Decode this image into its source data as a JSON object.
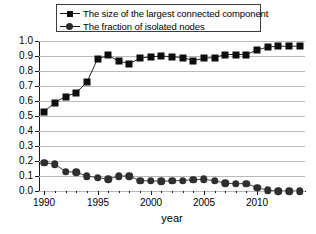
{
  "chart_data": {
    "type": "line",
    "title": "",
    "subtitle": "",
    "xlabel": "year",
    "ylabel": "",
    "xlim": [
      1989.5,
      2014.5
    ],
    "ylim": [
      0.0,
      1.0
    ],
    "grid": "horizontal",
    "legend_position": "top",
    "x": [
      1990,
      1991,
      1992,
      1993,
      1994,
      1995,
      1996,
      1997,
      1998,
      1999,
      2000,
      2001,
      2002,
      2003,
      2004,
      2005,
      2006,
      2007,
      2008,
      2009,
      2010,
      2011,
      2012,
      2013,
      2014
    ],
    "series": [
      {
        "name": "The size of the largest connected component",
        "marker": "square",
        "color": "#0d0d0d",
        "values": [
          0.53,
          0.59,
          0.63,
          0.655,
          0.725,
          0.88,
          0.905,
          0.865,
          0.85,
          0.885,
          0.895,
          0.9,
          0.895,
          0.89,
          0.87,
          0.885,
          0.89,
          0.91,
          0.91,
          0.91,
          0.94,
          0.96,
          0.965,
          0.965,
          0.965
        ]
      },
      {
        "name": "The fraction of isolated nodes",
        "marker": "circle",
        "color": "#2e2e2e",
        "values": [
          0.19,
          0.178,
          0.13,
          0.125,
          0.1,
          0.09,
          0.078,
          0.1,
          0.1,
          0.068,
          0.068,
          0.065,
          0.068,
          0.07,
          0.075,
          0.078,
          0.068,
          0.052,
          0.048,
          0.05,
          0.022,
          0.005,
          0.0,
          0.0,
          0.0
        ]
      }
    ],
    "yticks": [
      "0.0",
      "0.1",
      "0.2",
      "0.3",
      "0.4",
      "0.5",
      "0.6",
      "0.7",
      "0.8",
      "0.9",
      "1.0"
    ],
    "ytick_values": [
      0.0,
      0.1,
      0.2,
      0.3,
      0.4,
      0.5,
      0.6,
      0.7,
      0.8,
      0.9,
      1.0
    ],
    "xticks": [
      "1990",
      "1995",
      "2000",
      "2005",
      "2010"
    ],
    "xtick_values": [
      1990,
      1995,
      2000,
      2005,
      2010
    ]
  },
  "legend": {
    "items": [
      {
        "label": "The size of the largest connected component",
        "marker": "square"
      },
      {
        "label": "The fraction of isolated nodes",
        "marker": "circle"
      }
    ]
  }
}
